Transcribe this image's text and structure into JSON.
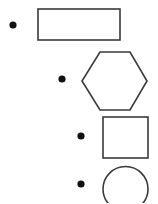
{
  "canvas": {
    "width": 158,
    "height": 203,
    "background_color": "#ffffff",
    "stroke_color": "#3a3a3a",
    "bullet_color": "#111111",
    "title": "Shapes and bullets staircase"
  },
  "chart_data": {
    "type": "scatter",
    "xlabel": "",
    "ylabel": "",
    "xlim": [
      0,
      158
    ],
    "ylim": [
      0,
      203
    ],
    "grid": false,
    "legend": null,
    "series": [
      {
        "name": "bullets",
        "marker": "filled-circle",
        "color": "#111111",
        "points": [
          {
            "x": 13,
            "y": 25,
            "r": 3.6
          },
          {
            "x": 62,
            "y": 79,
            "r": 3.6
          },
          {
            "x": 81,
            "y": 136,
            "r": 3.6
          },
          {
            "x": 81,
            "y": 184,
            "r": 3.6
          }
        ]
      },
      {
        "name": "shapes",
        "marker": "outline",
        "color": "#3a3a3a",
        "points": [
          {
            "x": 79,
            "y": 24.5,
            "shape": "rectangle"
          },
          {
            "x": 114.5,
            "y": 80.5,
            "shape": "hexagon"
          },
          {
            "x": 125.5,
            "y": 137.5,
            "shape": "square"
          },
          {
            "x": 125.5,
            "y": 189,
            "shape": "circle"
          }
        ]
      }
    ]
  },
  "rows": [
    {
      "index": 1,
      "bullet": {
        "name": "bullet-dot-1",
        "cx": 13,
        "cy": 25,
        "r": 3.6
      },
      "shape": {
        "name": "rectangle-shape",
        "kind": "rectangle",
        "x": 38,
        "y": 9,
        "width": 82,
        "height": 31
      }
    },
    {
      "index": 2,
      "bullet": {
        "name": "bullet-dot-2",
        "cx": 62,
        "cy": 79,
        "r": 3.6
      },
      "shape": {
        "name": "hexagon-shape",
        "kind": "hexagon",
        "points": "100,52 130,52 147,81 130,110 100,110 82,81"
      }
    },
    {
      "index": 3,
      "bullet": {
        "name": "bullet-dot-3",
        "cx": 81,
        "cy": 136,
        "r": 3.6
      },
      "shape": {
        "name": "square-shape",
        "kind": "square",
        "x": 103,
        "y": 117,
        "width": 45,
        "height": 41
      }
    },
    {
      "index": 4,
      "bullet": {
        "name": "bullet-dot-4",
        "cx": 81,
        "cy": 184,
        "r": 3.6
      },
      "shape": {
        "name": "circle-shape",
        "kind": "circle",
        "cx": 125.5,
        "cy": 189,
        "r": 22.5,
        "clipped_at_bottom": true
      }
    }
  ]
}
